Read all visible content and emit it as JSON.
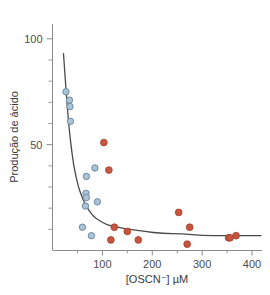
{
  "chart_data": {
    "type": "scatter",
    "title": "",
    "xlabel": "[OSCN⁻] µM",
    "ylabel": "Produção de ácido",
    "xlim": [
      0,
      420
    ],
    "ylim": [
      0,
      107
    ],
    "grid": false,
    "legend": null,
    "xticks": [
      100,
      200,
      300,
      400
    ],
    "xtick_labels": [
      "100",
      "200",
      "300",
      "400"
    ],
    "xticks_minor": [
      50,
      150,
      250,
      350
    ],
    "yticks": [
      50,
      100
    ],
    "ytick_labels": [
      "50",
      "100"
    ],
    "yticks_minor": [
      10,
      20,
      30,
      40,
      60,
      70,
      80,
      90
    ],
    "colors": {
      "blue_fill": "#aac3d6",
      "blue_stroke": "#6d8ba3",
      "red_fill": "#c45640",
      "red_stroke": "#a8402c",
      "axis": "#8a8a8a",
      "curve": "#4a4a4a",
      "text": "#3a3a3a"
    },
    "series": [
      {
        "name": "blue-open-circles",
        "marker": "open-circle",
        "color": "#aac3d6",
        "points": [
          [
            27,
            75
          ],
          [
            34,
            71
          ],
          [
            35,
            68
          ],
          [
            36,
            61
          ],
          [
            85,
            39
          ],
          [
            68,
            35
          ],
          [
            67,
            27
          ],
          [
            68,
            25
          ],
          [
            66,
            21
          ],
          [
            90,
            23
          ],
          [
            60,
            11
          ],
          [
            78,
            7
          ]
        ]
      },
      {
        "name": "red-filled-circles",
        "marker": "filled-circle",
        "color": "#c45640",
        "points": [
          [
            103,
            51
          ],
          [
            113,
            38
          ],
          [
            124,
            11
          ],
          [
            150,
            9
          ],
          [
            117,
            5
          ],
          [
            172,
            5
          ],
          [
            253,
            18
          ],
          [
            275,
            11
          ],
          [
            270,
            3
          ],
          [
            353,
            6
          ],
          [
            356,
            6
          ],
          [
            368,
            7
          ]
        ]
      }
    ],
    "fit_curve": {
      "name": "decay-fit",
      "color": "#4a4a4a",
      "description": "monotonic decaying curve through the data",
      "points": [
        [
          22,
          93
        ],
        [
          25,
          83
        ],
        [
          28,
          73
        ],
        [
          31,
          64
        ],
        [
          34,
          56
        ],
        [
          38,
          48
        ],
        [
          42,
          41
        ],
        [
          47,
          35
        ],
        [
          52,
          30
        ],
        [
          58,
          26
        ],
        [
          65,
          22
        ],
        [
          73,
          19
        ],
        [
          82,
          16
        ],
        [
          95,
          14
        ],
        [
          110,
          12
        ],
        [
          130,
          11
        ],
        [
          155,
          10
        ],
        [
          185,
          9
        ],
        [
          220,
          8
        ],
        [
          260,
          8
        ],
        [
          300,
          7
        ],
        [
          345,
          7
        ],
        [
          390,
          7
        ],
        [
          418,
          7
        ]
      ]
    }
  }
}
